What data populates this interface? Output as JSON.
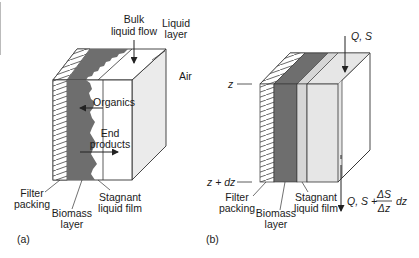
{
  "figure": {
    "colors": {
      "outline": "#333333",
      "biomass": "#6e6e6e",
      "stagnant_film": "#d6d6d6",
      "liquid_layer": "#e6e6e6",
      "hatch": "#444444",
      "background": "#ffffff"
    },
    "panel_a": {
      "caption": "(a)",
      "labels": {
        "bulk_flow_line1": "Bulk",
        "bulk_flow_line2": "liquid flow",
        "liquid_layer_line1": "Liquid",
        "liquid_layer_line2": "layer",
        "air": "Air",
        "organics": "Organics",
        "end_products_line1": "End",
        "end_products_line2": "products",
        "filter_packing_line1": "Filter",
        "filter_packing_line2": "packing",
        "biomass_line1": "Biomass",
        "biomass_line2": "layer",
        "stagnant_line1": "Stagnant",
        "stagnant_line2": "liquid film"
      }
    },
    "panel_b": {
      "caption": "(b)",
      "labels": {
        "inflow": "Q, S",
        "z": "z",
        "z_dz": "z + dz",
        "outflow_prefix": "Q, S +",
        "frac_num": "ΔS",
        "frac_den": "Δz",
        "outflow_suffix": "dz",
        "filter_packing_line1": "Filter",
        "filter_packing_line2": "packing",
        "biomass_line1": "Biomass",
        "biomass_line2": "layer",
        "stagnant_line1": "Stagnant",
        "stagnant_line2": "liquid film"
      }
    }
  }
}
